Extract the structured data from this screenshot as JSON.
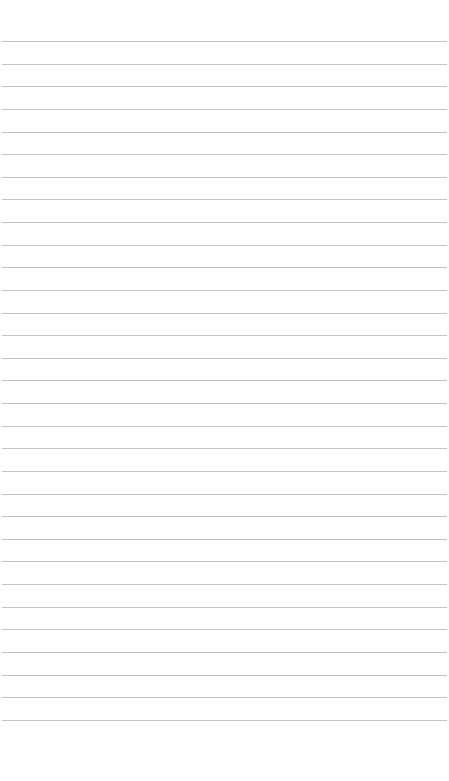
{
  "page": {
    "type": "lined-paper",
    "background": "#ffffff",
    "line_color": "#c4c4c4",
    "line_count": 31,
    "first_line_y": 41,
    "line_spacing": 22.63,
    "line_left": 2,
    "line_width": 445
  }
}
